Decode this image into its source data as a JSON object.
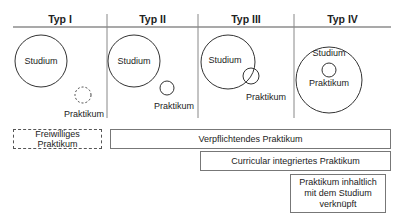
{
  "headers": [
    "Typ I",
    "Typ II",
    "Typ III",
    "Typ IV"
  ],
  "circles": {
    "studium": "Studium",
    "praktikum": "Praktikum"
  },
  "bars": {
    "freiwillig": "Freiwilliges Praktikum",
    "verpflichtend": "Verpflichtendes Praktikum",
    "curricular": "Curricular integriertes Praktikum",
    "inhaltlich": "Praktikum inhaltlich mit dem Studium verknüpft"
  }
}
